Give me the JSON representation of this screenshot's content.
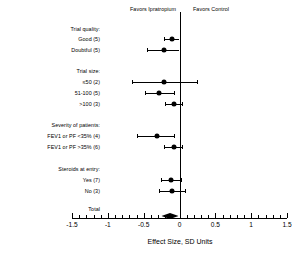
{
  "header": {
    "favors_left": "Favors Ipratropium",
    "favors_right": "Favors Control"
  },
  "axis": {
    "title": "Effect Size, SD Units",
    "ticks": [
      "-1.5",
      "-1",
      "-0.5",
      "0",
      "0.5",
      "1",
      "1.5"
    ],
    "min": -1.5,
    "max": 1.5
  },
  "rows": {
    "g1_head": "Trial quality:",
    "g1_a": "Good (5)",
    "g1_b": "Doubtful (5)",
    "g2_head": "Trial size:",
    "g2_a": "≤50 (2)",
    "g2_b": "51-100 (5)",
    "g2_c": ">100 (3)",
    "g3_head": "Severity of patients:",
    "g3_a": "FEV1 or PF <35% (4)",
    "g3_b": "FEV1 or PF >35% (6)",
    "g4_head": "Steroids at entry:",
    "g4_a": "Yes (7)",
    "g4_b": "No (3)",
    "total": "Total"
  },
  "chart_data": {
    "type": "scatter",
    "subtype": "forest-plot",
    "title": "",
    "xlabel": "Effect Size, SD Units",
    "ylabel": "",
    "xlim": [
      -1.5,
      1.5
    ],
    "grid": false,
    "null_line": 0,
    "legend": "none",
    "annotations": [
      "Favors Ipratropium",
      "Favors Control"
    ],
    "categories": [
      "Trial quality:",
      "Good (5)",
      "Doubtful (5)",
      "Trial size:",
      "≤50 (2)",
      "51-100 (5)",
      ">100 (3)",
      "Severity of patients:",
      "FEV1 or PF <35% (4)",
      "FEV1 or PF >35% (6)",
      "Steroids at entry:",
      "Yes (7)",
      "No (3)",
      "Total"
    ],
    "points": [
      {
        "label": "Good (5)",
        "estimate": -0.1,
        "ci_low": -0.22,
        "ci_high": 0.0,
        "group": "Trial quality",
        "marker": "circle"
      },
      {
        "label": "Doubtful (5)",
        "estimate": -0.22,
        "ci_low": -0.46,
        "ci_high": 0.0,
        "group": "Trial quality",
        "marker": "circle"
      },
      {
        "label": "≤50 (2)",
        "estimate": -0.22,
        "ci_low": -0.66,
        "ci_high": 0.24,
        "group": "Trial size",
        "marker": "circle"
      },
      {
        "label": "51-100 (5)",
        "estimate": -0.28,
        "ci_low": -0.48,
        "ci_high": -0.08,
        "group": "Trial size",
        "marker": "circle"
      },
      {
        "label": ">100 (3)",
        "estimate": -0.08,
        "ci_low": -0.2,
        "ci_high": 0.04,
        "group": "Trial size",
        "marker": "circle"
      },
      {
        "label": "FEV1 or PF <35% (4)",
        "estimate": -0.32,
        "ci_low": -0.6,
        "ci_high": -0.08,
        "group": "Severity",
        "marker": "circle"
      },
      {
        "label": "FEV1 or PF >35% (6)",
        "estimate": -0.08,
        "ci_low": -0.22,
        "ci_high": 0.04,
        "group": "Severity",
        "marker": "circle"
      },
      {
        "label": "Yes (7)",
        "estimate": -0.12,
        "ci_low": -0.26,
        "ci_high": 0.02,
        "group": "Steroids",
        "marker": "circle"
      },
      {
        "label": "No (3)",
        "estimate": -0.1,
        "ci_low": -0.28,
        "ci_high": 0.08,
        "group": "Steroids",
        "marker": "circle"
      },
      {
        "label": "Total",
        "estimate": -0.13,
        "ci_low": -0.25,
        "ci_high": -0.01,
        "group": "Overall",
        "marker": "diamond"
      }
    ]
  }
}
